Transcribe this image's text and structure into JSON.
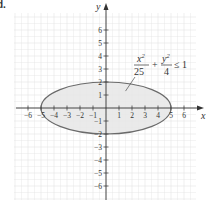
{
  "figure": {
    "corner_label": "d.",
    "colors": {
      "grid": "#e4e4e4",
      "axis": "#333333",
      "ellipse_stroke": "#6a6a6a",
      "ellipse_fill": "#e6e6e6",
      "text": "#333333"
    }
  },
  "chart_data": {
    "type": "area",
    "title": "",
    "xlabel": "x",
    "ylabel": "y",
    "xlim": [
      -7,
      7
    ],
    "ylim": [
      -7,
      7
    ],
    "grid": true,
    "x_ticks": [
      -6,
      -5,
      -4,
      -3,
      -2,
      -1,
      1,
      2,
      3,
      4,
      5,
      6
    ],
    "y_ticks": [
      -6,
      -5,
      -4,
      -3,
      -2,
      -1,
      1,
      2,
      3,
      4,
      5,
      6
    ],
    "x_tick_labels": [
      "−6",
      "−5",
      "−4",
      "−3",
      "−2",
      "−1",
      "1",
      "2",
      "3",
      "4",
      "5",
      "6"
    ],
    "y_tick_labels": [
      "−6",
      "−5",
      "−4",
      "−3",
      "−2",
      "−1",
      "1",
      "2",
      "3",
      "4",
      "5",
      "6"
    ],
    "region": {
      "shape": "ellipse",
      "center": [
        0,
        0
      ],
      "semi_axis_x": 5,
      "semi_axis_y": 2,
      "shaded": "interior",
      "boundary": "solid"
    },
    "annotation": {
      "text": "x^2/25 + y^2/4 ≤ 1",
      "num1": "x",
      "exp1": "2",
      "den1": "25",
      "plus": "+",
      "num2": "y",
      "exp2": "2",
      "den2": "4",
      "rel": "≤ 1",
      "pointer_to": [
        1.5,
        1.3
      ]
    }
  }
}
